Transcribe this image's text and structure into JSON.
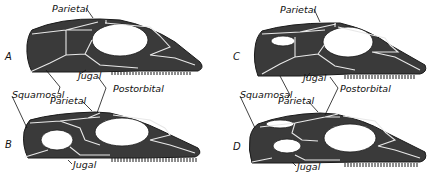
{
  "figure": {
    "panels": [
      {
        "id": "A",
        "label": "A",
        "labels": {
          "parietal": "Parietal",
          "jugal": "Jugal"
        }
      },
      {
        "id": "C",
        "label": "C",
        "labels": {
          "parietal": "Parietal",
          "jugal": "Jugal"
        }
      },
      {
        "id": "B",
        "label": "B",
        "labels": {
          "parietal": "Parietal",
          "jugal": "Jugal"
        }
      },
      {
        "id": "D",
        "label": "D",
        "labels": {
          "parietal": "Parietal",
          "jugal": "Jugal"
        }
      }
    ],
    "shared_labels": {
      "left_squamosal": "Squamosal",
      "left_postorbital": "Postorbital",
      "right_squamosal": "Squamosal",
      "right_postorbital": "Postorbital"
    }
  }
}
